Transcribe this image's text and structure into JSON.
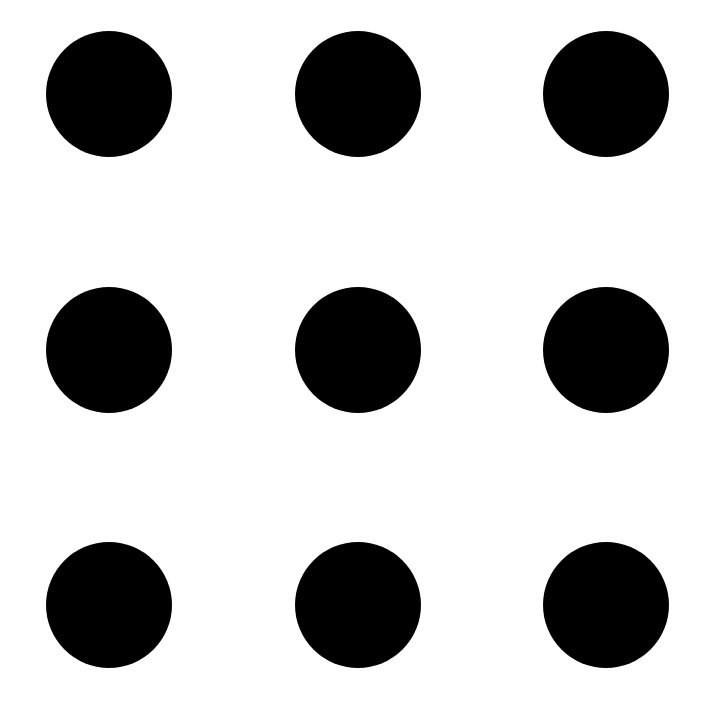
{
  "canvas": {
    "width": 704,
    "height": 711,
    "background": "#ffffff"
  },
  "grid": {
    "rows": 3,
    "cols": 3,
    "dot_color": "#000000",
    "dot_diameter": 126,
    "col_centers": [
      109,
      358,
      606
    ],
    "row_centers": [
      94,
      350,
      605
    ]
  }
}
